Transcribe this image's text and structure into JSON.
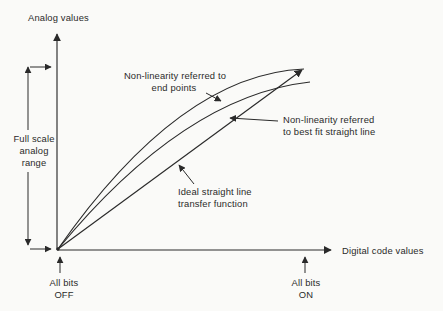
{
  "diagram": {
    "y_axis_label": "Analog values",
    "x_axis_label": "Digital code values",
    "full_scale_label": {
      "l1": "Full scale",
      "l2": "analog",
      "l3": "range"
    },
    "labels": {
      "endpoints": {
        "l1": "Non-linearity referred to",
        "l2": "end points"
      },
      "bestfit": {
        "l1": "Non-linearity referred",
        "l2": "to best fit straight line"
      },
      "ideal": {
        "l1": "Ideal straight line",
        "l2": "transfer function"
      }
    },
    "markers": {
      "all_bits_off": {
        "l1": "All bits",
        "l2": "OFF"
      },
      "all_bits_on": {
        "l1": "All bits",
        "l2": "ON"
      }
    },
    "colors": {
      "ink": "#2a2a2a",
      "background": "#fafaf8"
    }
  }
}
